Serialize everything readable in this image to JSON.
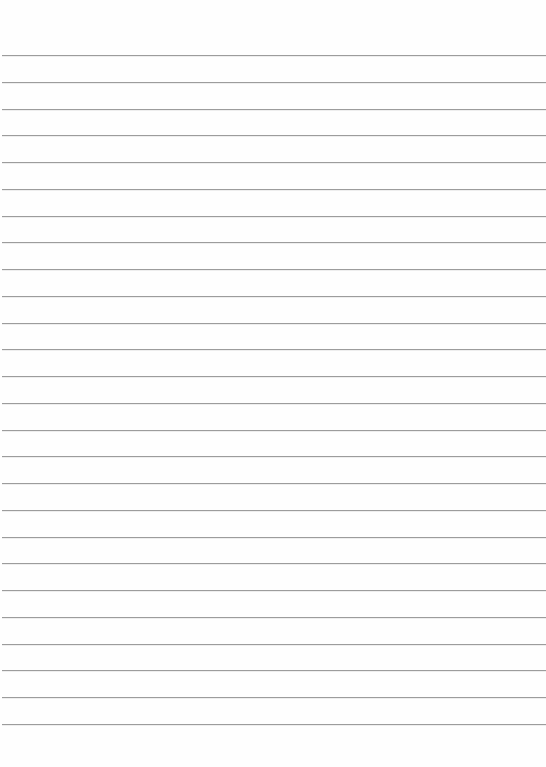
{
  "paper": {
    "type": "lined-paper",
    "background_color": "#fefefe",
    "line_color": "#9c9c9c",
    "line_count": 26,
    "first_line_y": 55,
    "line_spacing": 26.76
  }
}
